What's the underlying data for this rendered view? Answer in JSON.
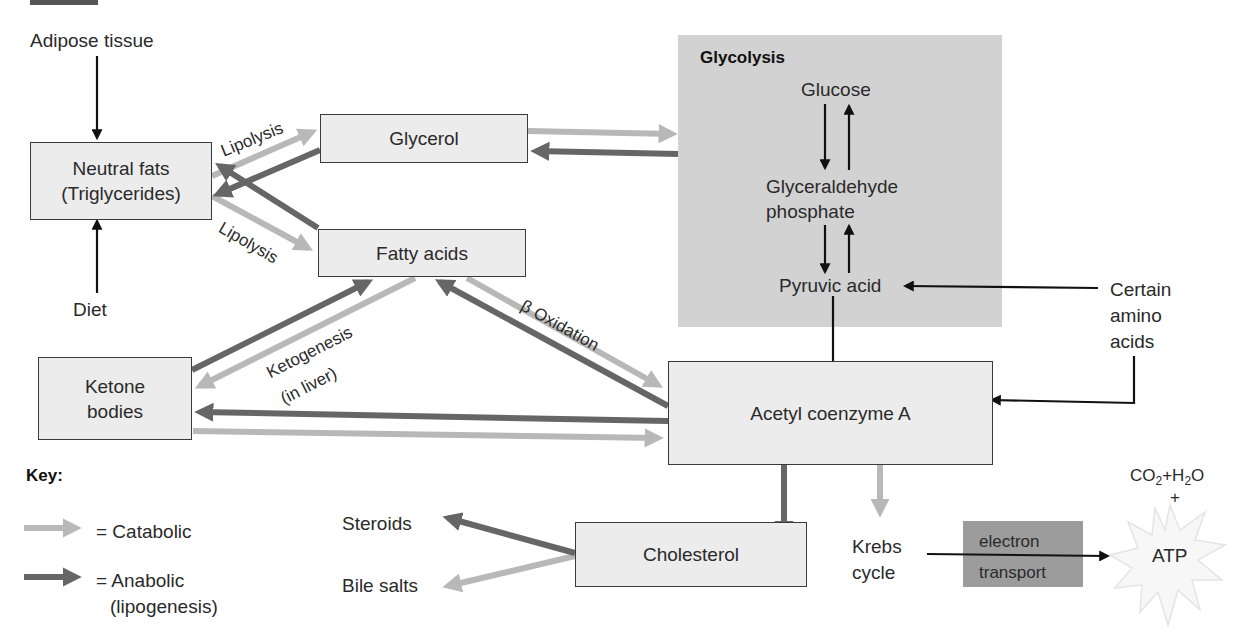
{
  "diagram": {
    "colors": {
      "catabolic": "#b8b8b8",
      "anabolic": "#666666",
      "neutral_arrow": "#111111",
      "box_fill": "#ececec",
      "glycolysis_fill": "#d2d2d2",
      "electron_transport_fill": "#9c9c9c"
    },
    "nodes": {
      "adipose": "Adipose tissue",
      "diet": "Diet",
      "neutral_fats_line1": "Neutral fats",
      "neutral_fats_line2": "(Triglycerides)",
      "glycerol": "Glycerol",
      "fatty_acids": "Fatty acids",
      "ketone_line1": "Ketone",
      "ketone_line2": "bodies",
      "acetyl_coa": "Acetyl coenzyme A",
      "cholesterol": "Cholesterol",
      "steroids": "Steroids",
      "bile_salts": "Bile salts",
      "krebs_line1": "Krebs",
      "krebs_line2": "cycle",
      "electron_line1": "electron",
      "electron_line2": "transport",
      "atp": "ATP",
      "co2_h2o_prefix": "CO",
      "co2_sub": "2",
      "plus_h": "+H",
      "h2o_sub": "2",
      "o": "O",
      "plus": "+",
      "amino_line1": "Certain",
      "amino_line2": "amino",
      "amino_line3": "acids"
    },
    "glycolysis": {
      "title": "Glycolysis",
      "glucose": "Glucose",
      "gap_line1": "Glyceraldehyde",
      "gap_line2": "phosphate",
      "pyruvic": "Pyruvic acid"
    },
    "edge_labels": {
      "lipolysis_top": "Lipolysis",
      "lipolysis_bottom": "Lipolysis",
      "ketogenesis_line1": "Ketogenesis",
      "ketogenesis_line2": "(in liver)",
      "beta_oxidation": "β Oxidation"
    },
    "key": {
      "title": "Key:",
      "items": [
        {
          "type": "catabolic",
          "label": "= Catabolic"
        },
        {
          "type": "anabolic",
          "label": "= Anabolic",
          "sublabel": "(lipogenesis)"
        }
      ]
    }
  }
}
